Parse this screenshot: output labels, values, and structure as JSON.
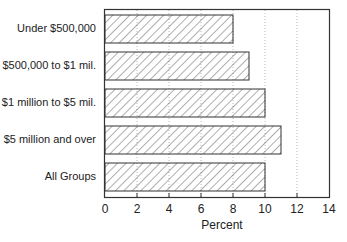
{
  "chart_data": {
    "type": "bar",
    "orientation": "horizontal",
    "title": "",
    "xlabel": "Percent",
    "ylabel": "",
    "categories": [
      "Under $500,000",
      "$500,000 to $1 mil.",
      "$1 million to $5 mil.",
      "$5 million and over",
      "All Groups"
    ],
    "values": [
      8,
      9,
      10,
      11,
      10
    ],
    "xlim": [
      0,
      14
    ],
    "xticks": [
      "0",
      "2",
      "4",
      "6",
      "8",
      "10",
      "12",
      "14"
    ],
    "grid": "vertical dotted",
    "bar_fill": "diagonal hatch",
    "legend": null
  },
  "axis": {
    "xlabel": "Percent",
    "ticks": [
      "0",
      "2",
      "4",
      "6",
      "8",
      "10",
      "12",
      "14"
    ]
  },
  "bars": [
    {
      "label": "Under $500,000",
      "value": 8
    },
    {
      "label": "$500,000 to $1 mil.",
      "value": 9
    },
    {
      "label": "$1 million to $5 mil.",
      "value": 10
    },
    {
      "label": "$5 million and over",
      "value": 11
    },
    {
      "label": "All Groups",
      "value": 10
    }
  ]
}
